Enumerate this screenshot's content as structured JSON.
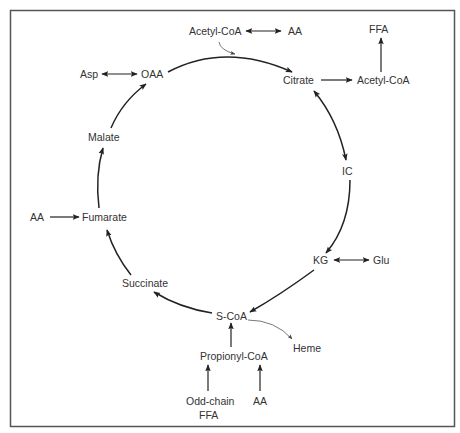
{
  "nodes": {
    "acetyl_coa_in": "Acetyl-CoA",
    "aa_top": "AA",
    "citrate": "Citrate",
    "acetyl_coa_out": "Acetyl-CoA",
    "ffa_top": "FFA",
    "ic": "IC",
    "kg": "KG",
    "glu": "Glu",
    "s_coa": "S-CoA",
    "heme": "Heme",
    "propionyl_coa": "Propionyl-CoA",
    "odd_chain": "Odd-chain",
    "odd_chain_ffa": "FFA",
    "aa_bottom": "AA",
    "succinate": "Succinate",
    "fumarate": "Fumarate",
    "aa_left": "AA",
    "malate": "Malate",
    "oaa": "OAA",
    "asp": "Asp"
  },
  "edges": [
    {
      "from": "OAA",
      "to": "Citrate",
      "type": "forward"
    },
    {
      "from": "Acetyl-CoA",
      "to": "Citrate",
      "type": "feeds-in"
    },
    {
      "from": "Citrate",
      "to": "IC",
      "type": "bidirectional"
    },
    {
      "from": "IC",
      "to": "KG",
      "type": "forward"
    },
    {
      "from": "KG",
      "to": "S-CoA",
      "type": "forward"
    },
    {
      "from": "S-CoA",
      "to": "Succinate",
      "type": "forward"
    },
    {
      "from": "Succinate",
      "to": "Fumarate",
      "type": "forward"
    },
    {
      "from": "Fumarate",
      "to": "Malate",
      "type": "forward"
    },
    {
      "from": "Malate",
      "to": "OAA",
      "type": "forward"
    },
    {
      "from": "Acetyl-CoA",
      "to": "AA",
      "type": "bidirectional"
    },
    {
      "from": "Citrate",
      "to": "Acetyl-CoA",
      "type": "forward"
    },
    {
      "from": "Acetyl-CoA",
      "to": "FFA",
      "type": "forward"
    },
    {
      "from": "KG",
      "to": "Glu",
      "type": "bidirectional"
    },
    {
      "from": "S-CoA",
      "to": "Heme",
      "type": "forward-thin"
    },
    {
      "from": "Propionyl-CoA",
      "to": "S-CoA",
      "type": "forward"
    },
    {
      "from": "Odd-chain FFA",
      "to": "Propionyl-CoA",
      "type": "forward"
    },
    {
      "from": "AA",
      "to": "Propionyl-CoA",
      "type": "forward"
    },
    {
      "from": "AA",
      "to": "Fumarate",
      "type": "forward"
    },
    {
      "from": "Asp",
      "to": "OAA",
      "type": "bidirectional"
    }
  ]
}
